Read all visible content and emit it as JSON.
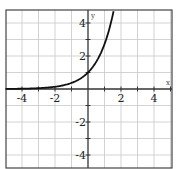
{
  "chart_data": {
    "type": "line",
    "title": "",
    "function": "y = e^x",
    "xlabel": "x",
    "ylabel": "y",
    "xlim": [
      -5,
      5
    ],
    "ylim": [
      -5,
      4.6
    ],
    "grid": true,
    "x_ticks": [
      -4,
      -2,
      2,
      4
    ],
    "y_ticks": [
      4,
      2,
      -2,
      -4
    ],
    "x_tick_labels": [
      "-4",
      "-2",
      "2",
      "4"
    ],
    "y_tick_labels": [
      "4",
      "2",
      "-2",
      "-4"
    ],
    "series": [
      {
        "name": "exponential curve",
        "x": [
          -5,
          -4,
          -3,
          -2,
          -1,
          -0.5,
          0,
          0.5,
          1,
          1.25,
          1.5
        ],
        "y": [
          0.007,
          0.018,
          0.05,
          0.135,
          0.368,
          0.607,
          1.0,
          1.649,
          2.718,
          3.49,
          4.48
        ]
      }
    ],
    "colors": {
      "curve": "#111111",
      "axis": "#333333",
      "grid": "#c8c8c8",
      "frame": "#444444"
    }
  }
}
